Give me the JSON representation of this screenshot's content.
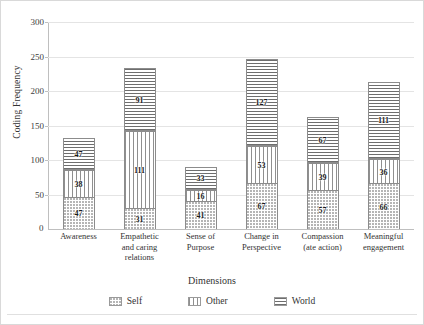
{
  "chart_data": {
    "type": "bar",
    "variant": "stacked-column",
    "title": "",
    "xlabel": "Dimensions",
    "ylabel": "Coding Frequency",
    "ylim": [
      0,
      300
    ],
    "yticks": [
      0,
      50,
      100,
      150,
      200,
      250,
      300
    ],
    "grid": true,
    "legend_position": "bottom",
    "categories": [
      "Awareness",
      "Empathetic and caring relations",
      "Sense of Purpose",
      "Change in Perspective",
      "Compassion (ate action)",
      "Meaningful engagement"
    ],
    "category_lines": [
      [
        "Awareness"
      ],
      [
        "Empathetic",
        "and caring",
        "relations"
      ],
      [
        "Sense of",
        "Purpose"
      ],
      [
        "Change in",
        "Perspective"
      ],
      [
        "Compassion",
        "(ate action)"
      ],
      [
        "Meaningful",
        "engagement"
      ]
    ],
    "series": [
      {
        "name": "Self",
        "pattern": "dotted",
        "values": [
          47,
          31,
          41,
          67,
          57,
          66
        ]
      },
      {
        "name": "Other",
        "pattern": "vertical-lines",
        "values": [
          38,
          111,
          16,
          53,
          39,
          36
        ]
      },
      {
        "name": "World",
        "pattern": "horizontal-lines",
        "values": [
          47,
          91,
          33,
          127,
          67,
          111
        ]
      }
    ],
    "totals": [
      132,
      233,
      90,
      247,
      163,
      213
    ]
  },
  "legend": {
    "items": [
      {
        "label": "Self"
      },
      {
        "label": "Other"
      },
      {
        "label": "World"
      }
    ]
  }
}
